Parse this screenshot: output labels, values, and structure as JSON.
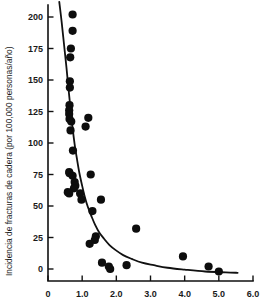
{
  "chart_data": {
    "type": "scatter",
    "title": "",
    "subtitle": "",
    "xlabel": "",
    "ylabel": "Incidencia de fracturas de cadera (por 100,000 personas/año)",
    "xlim": [
      0,
      6.0
    ],
    "ylim": [
      -10,
      210
    ],
    "grid": false,
    "legend": null,
    "xticks": [
      "0",
      "1.0",
      "2.0",
      "3.0",
      "4.0",
      "5.0",
      "6.0"
    ],
    "xtick_values": [
      0,
      1.0,
      2.0,
      3.0,
      4.0,
      5.0,
      6.0
    ],
    "yticks": [
      "0",
      "25",
      "50",
      "75",
      "100",
      "125",
      "150",
      "175",
      "200"
    ],
    "ytick_values": [
      0,
      25,
      50,
      75,
      100,
      125,
      150,
      175,
      200
    ],
    "series": [
      {
        "name": "points",
        "marker": "filled-circle",
        "color": "#0d0d0d",
        "points": [
          [
            0.72,
            202
          ],
          [
            0.72,
            189
          ],
          [
            0.67,
            175
          ],
          [
            0.65,
            168
          ],
          [
            0.64,
            149
          ],
          [
            0.64,
            144
          ],
          [
            0.63,
            130
          ],
          [
            0.62,
            126
          ],
          [
            0.62,
            123
          ],
          [
            0.63,
            119
          ],
          [
            0.68,
            117
          ],
          [
            0.66,
            110
          ],
          [
            1.18,
            120
          ],
          [
            1.1,
            113
          ],
          [
            0.73,
            94
          ],
          [
            0.62,
            77
          ],
          [
            0.63,
            76
          ],
          [
            0.72,
            74
          ],
          [
            1.25,
            75
          ],
          [
            0.78,
            69
          ],
          [
            0.8,
            66
          ],
          [
            0.76,
            64
          ],
          [
            0.58,
            61
          ],
          [
            0.62,
            60
          ],
          [
            0.94,
            60
          ],
          [
            0.98,
            55
          ],
          [
            1.55,
            55
          ],
          [
            1.3,
            46
          ],
          [
            2.58,
            32
          ],
          [
            1.4,
            26
          ],
          [
            1.37,
            23
          ],
          [
            1.22,
            20
          ],
          [
            1.58,
            5
          ],
          [
            1.78,
            2
          ],
          [
            1.82,
            0
          ],
          [
            2.3,
            3
          ],
          [
            3.95,
            10
          ],
          [
            4.7,
            2
          ],
          [
            5.0,
            -2
          ]
        ]
      }
    ],
    "fit_curve": {
      "name": "exponential-decay-fit",
      "color": "#111111",
      "points": [
        [
          0.33,
          212
        ],
        [
          0.4,
          196
        ],
        [
          0.47,
          178
        ],
        [
          0.54,
          160
        ],
        [
          0.6,
          143
        ],
        [
          0.66,
          127
        ],
        [
          0.72,
          112
        ],
        [
          0.78,
          99
        ],
        [
          0.85,
          87
        ],
        [
          0.92,
          76
        ],
        [
          1.0,
          66
        ],
        [
          1.08,
          57
        ],
        [
          1.17,
          49
        ],
        [
          1.27,
          42
        ],
        [
          1.38,
          35
        ],
        [
          1.5,
          29
        ],
        [
          1.64,
          24
        ],
        [
          1.8,
          19
        ],
        [
          1.98,
          15
        ],
        [
          2.2,
          11
        ],
        [
          2.45,
          8
        ],
        [
          2.75,
          5
        ],
        [
          3.1,
          3
        ],
        [
          3.5,
          1
        ],
        [
          4.0,
          -0.5
        ],
        [
          4.6,
          -2
        ],
        [
          5.2,
          -2.7
        ],
        [
          5.55,
          -3
        ]
      ]
    }
  },
  "axes": {
    "y_axis_title": "Incidencia de fracturas de cadera (por 100,000 personas/año)"
  }
}
